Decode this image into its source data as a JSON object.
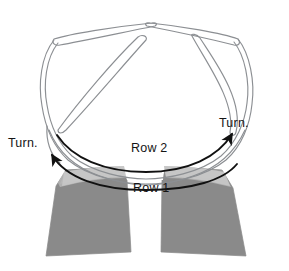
{
  "figure": {
    "title": "",
    "kind": "knitting-short-row-diagram",
    "labels": {
      "turn_left": "Turn.",
      "turn_right": "Turn.",
      "row_2": "Row 2",
      "row_1": "Row 1"
    },
    "icons": {
      "arrow_row2": "curved-arrow-right-icon",
      "arrow_row1": "curved-arrow-left-icon"
    },
    "colors": {
      "background": "#ffffff",
      "needle_outline": "#8c8f93",
      "fabric_dark_gray": "#8a8a8a",
      "fabric_light_gray": "#b9b9b9",
      "fabric_mid_gray": "#9e9e9e",
      "arrow_stroke": "#111111",
      "text": "#151515"
    },
    "elements": [
      "circular-needle-loop",
      "needle-tip-left",
      "needle-tip-right",
      "fabric-leg-left",
      "fabric-leg-right",
      "short-row-wedge-left",
      "short-row-wedge-right"
    ]
  }
}
